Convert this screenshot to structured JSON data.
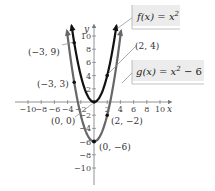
{
  "chart_data": {
    "type": "line",
    "title": "",
    "xlabel": "x",
    "ylabel": "y",
    "xlim": [
      -11,
      11
    ],
    "ylim": [
      -11,
      11
    ],
    "grid": false,
    "x_ticks": [
      -10,
      -8,
      -6,
      -4,
      -2,
      2,
      4,
      6,
      8,
      10
    ],
    "y_ticks": [
      10,
      8,
      6,
      4,
      2,
      -2,
      -4,
      -6,
      -8,
      -10
    ],
    "x_tick_labels": [
      "−10",
      "−8",
      "−6",
      "−4",
      "−2",
      "2",
      "4",
      "6",
      "8",
      "10"
    ],
    "y_tick_labels": [
      "10",
      "8",
      "6",
      "4",
      "2",
      "−2",
      "−4",
      "−6",
      "−8",
      "−10"
    ],
    "series": [
      {
        "name": "f(x) = x^2",
        "color": "#111111",
        "x": [
          -3.4,
          -3,
          -2,
          -1,
          0,
          1,
          2,
          3,
          3.4
        ],
        "values": [
          11.56,
          9,
          4,
          1,
          0,
          1,
          4,
          9,
          11.56
        ]
      },
      {
        "name": "g(x) = x^2 − 6",
        "color": "#666666",
        "x": [
          -4.1,
          -3,
          -2,
          -1,
          0,
          1,
          2,
          3,
          4.1
        ],
        "values": [
          10.81,
          3,
          -2,
          -5,
          -6,
          -5,
          -2,
          3,
          10.81
        ]
      }
    ],
    "annotations": [
      {
        "text": "(−3, 9)",
        "x": -3,
        "y": 9,
        "series": "f"
      },
      {
        "text": "(2, 4)",
        "x": 2,
        "y": 4,
        "series": "f"
      },
      {
        "text": "(0, 0)",
        "x": 0,
        "y": 0,
        "series": "f"
      },
      {
        "text": "(−3, 3)",
        "x": -3,
        "y": 3,
        "series": "g"
      },
      {
        "text": "(2, −2)",
        "x": 2,
        "y": -2,
        "series": "g"
      },
      {
        "text": "(0, −6)",
        "x": 0,
        "y": -6,
        "series": "g"
      }
    ],
    "legend": [
      {
        "label_fn": "f(x) = x",
        "sup": "2",
        "suffix": ""
      },
      {
        "label_fn": "g(x) = x",
        "sup": "2",
        "suffix": " − 6"
      }
    ],
    "legend_position": "upper right"
  },
  "labels": {
    "x_axis": "x",
    "y_axis": "y",
    "f_legend_main": "f(x) = x",
    "f_legend_sup": "2",
    "g_legend_main": "g(x) = x",
    "g_legend_sup": "2",
    "g_legend_suffix": " − 6",
    "p_m3_9": "(−3, 9)",
    "p_2_4": "(2, 4)",
    "p_0_0": "(0, 0)",
    "p_m3_3": "(−3, 3)",
    "p_2_m2": "(2, −2)",
    "p_0_m6": "(0, −6)"
  }
}
